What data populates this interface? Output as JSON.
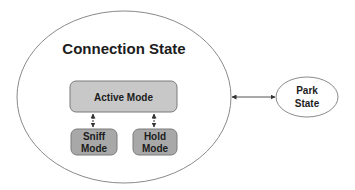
{
  "diagram": {
    "connection_state": {
      "title": "Connection State"
    },
    "active_mode": {
      "label": "Active Mode"
    },
    "sniff_mode": {
      "line1": "Sniff",
      "line2": "Mode"
    },
    "hold_mode": {
      "line1": "Hold",
      "line2": "Mode"
    },
    "park_state": {
      "line1": "Park",
      "line2": "State"
    }
  },
  "colors": {
    "ellipse_stroke": "#8a8a8a",
    "active_fill": "#c8c8c8",
    "mode_fill": "#a8a8a8",
    "box_stroke": "#7a7a7a",
    "arrow": "#333333",
    "text": "#1c1c1c"
  }
}
